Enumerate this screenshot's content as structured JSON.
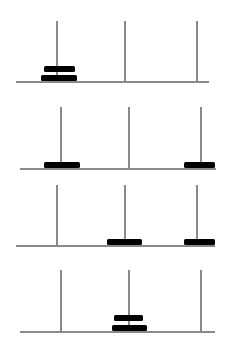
{
  "diagram": {
    "colors": {
      "background": "#ffffff",
      "peg": "#8a8a8a",
      "base": "#8a8a8a",
      "disk": "#000000"
    },
    "steps": [
      {
        "step": 1,
        "base": {
          "x1": 16,
          "x2": 209,
          "y": 81
        },
        "pegs": [
          {
            "x": 57,
            "top": 21
          },
          {
            "x": 125,
            "top": 21
          },
          {
            "x": 197,
            "top": 21
          }
        ],
        "disks": [
          {
            "size": "small",
            "peg": 1,
            "x": 44,
            "y": 66,
            "w": 31,
            "h": 6
          },
          {
            "size": "large",
            "peg": 1,
            "x": 41,
            "y": 75,
            "w": 36,
            "h": 6
          }
        ]
      },
      {
        "step": 2,
        "base": {
          "x1": 20,
          "x2": 216,
          "y": 168
        },
        "pegs": [
          {
            "x": 61,
            "top": 107
          },
          {
            "x": 129,
            "top": 107
          },
          {
            "x": 201,
            "top": 107
          }
        ],
        "disks": [
          {
            "size": "large",
            "peg": 1,
            "x": 44,
            "y": 162,
            "w": 36,
            "h": 6
          },
          {
            "size": "small",
            "peg": 3,
            "x": 184,
            "y": 162,
            "w": 31,
            "h": 6
          }
        ]
      },
      {
        "step": 3,
        "base": {
          "x1": 16,
          "x2": 215,
          "y": 245
        },
        "pegs": [
          {
            "x": 57,
            "top": 185
          },
          {
            "x": 125,
            "top": 185
          },
          {
            "x": 197,
            "top": 185
          }
        ],
        "disks": [
          {
            "size": "large",
            "peg": 2,
            "x": 107,
            "y": 239,
            "w": 35,
            "h": 6
          },
          {
            "size": "small",
            "peg": 3,
            "x": 184,
            "y": 239,
            "w": 31,
            "h": 6
          }
        ]
      },
      {
        "step": 4,
        "base": {
          "x1": 20,
          "x2": 215,
          "y": 331
        },
        "pegs": [
          {
            "x": 61,
            "top": 270
          },
          {
            "x": 129,
            "top": 270
          },
          {
            "x": 201,
            "top": 270
          }
        ],
        "disks": [
          {
            "size": "small",
            "peg": 2,
            "x": 114,
            "y": 315,
            "w": 29,
            "h": 6
          },
          {
            "size": "large",
            "peg": 2,
            "x": 112,
            "y": 325,
            "w": 35,
            "h": 6
          }
        ]
      }
    ]
  }
}
